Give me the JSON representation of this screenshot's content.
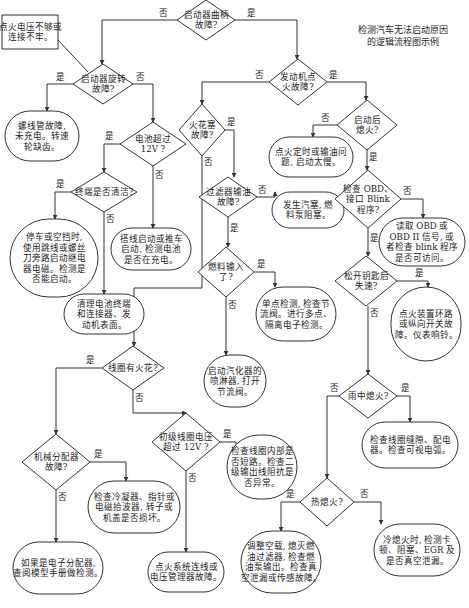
{
  "title": [
    "检测汽车无法启动原因",
    "的逻辑流程图示例"
  ],
  "labels": {
    "yes": "是",
    "no": "否"
  },
  "nodes": [
    {
      "id": "crank",
      "type": "decision",
      "lines": [
        "启动器曲柄",
        "故障?"
      ]
    },
    {
      "id": "voltage_box",
      "type": "process",
      "lines": [
        "点火电压不够或",
        "连接不牢。"
      ]
    },
    {
      "id": "starter_spin",
      "type": "decision",
      "lines": [
        "启动器旋转",
        "故障?"
      ]
    },
    {
      "id": "solenoid",
      "type": "terminal",
      "lines": [
        "螺线管故障,",
        "未充电。转速",
        "轮缺齿。"
      ]
    },
    {
      "id": "battery12",
      "type": "decision",
      "lines": [
        "电池超过",
        "12V ?"
      ]
    },
    {
      "id": "terminal_clean",
      "type": "decision",
      "lines": [
        "终端是否清洁?"
      ]
    },
    {
      "id": "jumper",
      "type": "terminal",
      "lines": [
        "停车或空挡时,",
        "使用跳线或螺丝",
        "刀旁路启动继电",
        "器电磁。检测是",
        "否能启动。"
      ]
    },
    {
      "id": "jumpstart",
      "type": "terminal",
      "lines": [
        "搭线启动或推车",
        "启动, 检测电池",
        "是否在充电。"
      ]
    },
    {
      "id": "clean_battery",
      "type": "terminal",
      "lines": [
        "清理电池终端",
        "和连接器、发",
        "动机表面。"
      ]
    },
    {
      "id": "ign_fault",
      "type": "decision",
      "lines": [
        "发动机点",
        "火故障?"
      ]
    },
    {
      "id": "spark_plug",
      "type": "decision",
      "lines": [
        "火花塞",
        "故障?"
      ]
    },
    {
      "id": "stall_after",
      "type": "decision",
      "lines": [
        "启动后",
        "熄火?"
      ]
    },
    {
      "id": "timing",
      "type": "terminal",
      "lines": [
        "点火定时或输油问",
        "题, 启动太慢。"
      ]
    },
    {
      "id": "filter",
      "type": "decision",
      "lines": [
        "过滤器输油",
        "故障?"
      ]
    },
    {
      "id": "vapor_lock",
      "type": "terminal",
      "lines": [
        "发生汽塞, 燃",
        "料泵阻塞。"
      ]
    },
    {
      "id": "obd",
      "type": "decision",
      "lines": [
        "检查 OBD、",
        "接口 Blink",
        "程序?"
      ]
    },
    {
      "id": "read_obd",
      "type": "terminal",
      "lines": [
        "读取 OBD 或",
        "OBD II 信号, 或",
        "者检查 blink 程序",
        "是否可访问。"
      ]
    },
    {
      "id": "fuel_input",
      "type": "decision",
      "lines": [
        "燃料输入",
        "了?"
      ]
    },
    {
      "id": "key_release",
      "type": "decision",
      "lines": [
        "松开钥匙后",
        "失速?"
      ]
    },
    {
      "id": "single_point",
      "type": "terminal",
      "lines": [
        "单点检测, 检查节",
        "流阀。进行多点、",
        "隔离电子检测。"
      ]
    },
    {
      "id": "ignition_switch",
      "type": "terminal",
      "lines": [
        "点火装置环路",
        "或纵向开关故",
        "障。仪表响铃。"
      ]
    },
    {
      "id": "carb",
      "type": "terminal",
      "lines": [
        "启动汽化器的",
        "喷淋器, 打开",
        "节流阀。"
      ]
    },
    {
      "id": "coil_spark",
      "type": "decision",
      "lines": [
        "线圈有火花?"
      ]
    },
    {
      "id": "rain_stall",
      "type": "decision",
      "lines": [
        "雨中熄火?"
      ]
    },
    {
      "id": "dist_fault",
      "type": "decision",
      "lines": [
        "机械分配器",
        "故障?"
      ]
    },
    {
      "id": "primary12",
      "type": "decision",
      "lines": [
        "初级线圈电压",
        "超过 12V ?"
      ]
    },
    {
      "id": "coil_gap",
      "type": "terminal",
      "lines": [
        "检查线圈缝隙、配电",
        "器。检查可视电弧。"
      ]
    },
    {
      "id": "condenser",
      "type": "terminal",
      "lines": [
        "检查冷凝器、指针或",
        "电磁拾波器, 转子或",
        "机盖是否损坏。"
      ]
    },
    {
      "id": "coil_internal",
      "type": "terminal",
      "lines": [
        "检查线圈内部是",
        "否短路。检查二",
        "级输出线阻抗是",
        "否异常。"
      ]
    },
    {
      "id": "hot_stall",
      "type": "decision",
      "lines": [
        "热熄火?"
      ]
    },
    {
      "id": "electronic_dist",
      "type": "terminal",
      "lines": [
        "如果是电子分配器,",
        "查阅模型手册做检测。"
      ]
    },
    {
      "id": "ign_wiring",
      "type": "terminal",
      "lines": [
        "点火系统连线或",
        "电压管理器故障。"
      ]
    },
    {
      "id": "idle_adjust",
      "type": "terminal",
      "lines": [
        "调整空载, 熄灭燃",
        "油过滤器, 检查燃",
        "油泵输出。检查真",
        "空泄漏或传感故障。"
      ]
    },
    {
      "id": "cold_stall",
      "type": "terminal",
      "lines": [
        "冷熄火时, 检测卡",
        "顿、阻塞、EGR 及",
        "是否真空泄漏。"
      ]
    }
  ],
  "edges": [
    {
      "from": "crank",
      "to": "starter_spin",
      "label": "no"
    },
    {
      "from": "crank",
      "to": "ign_fault",
      "label": "yes"
    },
    {
      "from": "voltage_box",
      "to": "starter_spin",
      "label": ""
    },
    {
      "from": "starter_spin",
      "to": "solenoid",
      "label": "yes"
    },
    {
      "from": "starter_spin",
      "to": "battery12",
      "label": "no"
    },
    {
      "from": "battery12",
      "to": "terminal_clean",
      "label": "yes"
    },
    {
      "from": "battery12",
      "to": "jumpstart",
      "label": "no"
    },
    {
      "from": "terminal_clean",
      "to": "jumper",
      "label": "yes"
    },
    {
      "from": "terminal_clean",
      "to": "clean_battery",
      "label": "no"
    },
    {
      "from": "ign_fault",
      "to": "spark_plug",
      "label": "no"
    },
    {
      "from": "ign_fault",
      "to": "stall_after",
      "label": "yes"
    },
    {
      "from": "spark_plug",
      "to": "filter",
      "label": "yes"
    },
    {
      "from": "spark_plug",
      "to": "coil_spark",
      "label": "no"
    },
    {
      "from": "stall_after",
      "to": "timing",
      "label": "no"
    },
    {
      "from": "stall_after",
      "to": "obd",
      "label": "yes"
    },
    {
      "from": "filter",
      "to": "vapor_lock",
      "label": "no"
    },
    {
      "from": "filter",
      "to": "fuel_input",
      "label": "yes"
    },
    {
      "from": "obd",
      "to": "read_obd",
      "label": "no"
    },
    {
      "from": "obd",
      "to": "key_release",
      "label": "yes"
    },
    {
      "from": "fuel_input",
      "to": "single_point",
      "label": "yes"
    },
    {
      "from": "fuel_input",
      "to": "carb",
      "label": "no"
    },
    {
      "from": "key_release",
      "to": "ignition_switch",
      "label": "yes"
    },
    {
      "from": "key_release",
      "to": "rain_stall",
      "label": "no"
    },
    {
      "from": "coil_spark",
      "to": "dist_fault",
      "label": "yes"
    },
    {
      "from": "coil_spark",
      "to": "primary12",
      "label": "no"
    },
    {
      "from": "rain_stall",
      "to": "coil_gap",
      "label": "yes"
    },
    {
      "from": "rain_stall",
      "to": "hot_stall",
      "label": "no"
    },
    {
      "from": "dist_fault",
      "to": "condenser",
      "label": "yes"
    },
    {
      "from": "dist_fault",
      "to": "electronic_dist",
      "label": "no"
    },
    {
      "from": "primary12",
      "to": "coil_internal",
      "label": "yes"
    },
    {
      "from": "primary12",
      "to": "ign_wiring",
      "label": "no"
    },
    {
      "from": "hot_stall",
      "to": "idle_adjust",
      "label": "yes"
    },
    {
      "from": "hot_stall",
      "to": "cold_stall",
      "label": "no"
    }
  ]
}
